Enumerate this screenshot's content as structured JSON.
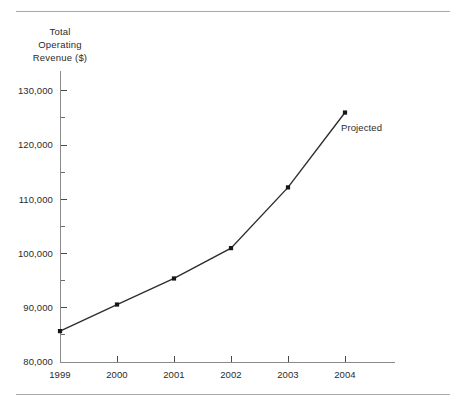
{
  "chart_data": {
    "type": "line",
    "title": "",
    "ylabel": "Total Operating Revenue ($)",
    "ylabel_lines": [
      "Total",
      "Operating",
      "Revenue ($)"
    ],
    "xlabel": "",
    "categories": [
      "1999",
      "2000",
      "2001",
      "2002",
      "2003",
      "2004"
    ],
    "values": [
      85700,
      90600,
      95400,
      101000,
      112200,
      126000
    ],
    "series": [
      {
        "name": "Total Operating Revenue ($)",
        "values": [
          85700,
          90600,
          95400,
          101000,
          112200,
          126000
        ]
      }
    ],
    "ylim": [
      80000,
      132000
    ],
    "ytick_values": [
      80000,
      90000,
      100000,
      110000,
      120000,
      130000
    ],
    "ytick_labels": [
      "80,000",
      "90,000",
      "100,000",
      "110,000",
      "120,000",
      "130,000"
    ],
    "yminor_tick_values": [
      85000,
      95000,
      105000,
      115000,
      125000
    ],
    "grid": false,
    "legend": false,
    "legend_position": "none",
    "annotations": [
      {
        "text": "Projected",
        "x_value": "2004",
        "near_value": 120000
      }
    ],
    "marker": "square",
    "line_color": "#2e2e2e",
    "marker_color": "#161616",
    "axis_color": "#8a8a8a",
    "text_color": "#2b2b2b",
    "background_color": "#ffffff",
    "rule_color": "#a8a8a8"
  }
}
